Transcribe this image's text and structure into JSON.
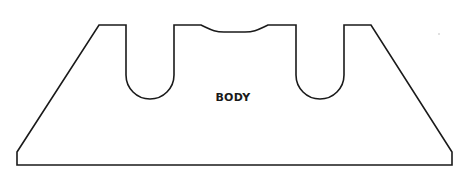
{
  "diagram": {
    "title": "",
    "shape": "trapezoidal body with two U-shaped slots and a shallow top recess",
    "label": "BODY",
    "stroke_color": "#1a1a1a",
    "background": "#ffffff"
  }
}
